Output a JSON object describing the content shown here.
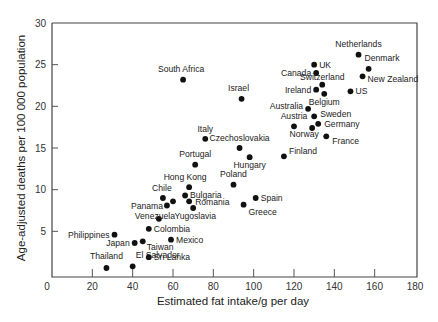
{
  "chart_data": {
    "type": "scatter",
    "title": "",
    "xlabel": "Estimated fat intake/g per day",
    "ylabel": "Age-adjusted deaths per 100 000 population",
    "xlim": [
      0,
      180
    ],
    "ylim": [
      0,
      30
    ],
    "x_ticks": [
      0,
      20,
      40,
      60,
      80,
      100,
      120,
      140,
      160,
      180
    ],
    "y_ticks": [
      5,
      10,
      15,
      20,
      25,
      30
    ],
    "grid": false,
    "legend": null,
    "points": [
      {
        "label": "Netherlands",
        "x": 152,
        "y": 26.2,
        "lx": 0,
        "ly": -8,
        "anchor": "middle"
      },
      {
        "label": "Denmark",
        "x": 157,
        "y": 24.5,
        "lx": -4,
        "ly": -8,
        "anchor": "start"
      },
      {
        "label": "UK",
        "x": 130,
        "y": 25.0,
        "lx": 5,
        "ly": 3,
        "anchor": "start"
      },
      {
        "label": "Canada",
        "x": 131,
        "y": 24.0,
        "lx": -5,
        "ly": 3,
        "anchor": "end"
      },
      {
        "label": "New Zealand",
        "x": 154,
        "y": 23.6,
        "lx": 5,
        "ly": 6,
        "anchor": "start"
      },
      {
        "label": "Switzerland",
        "x": 134,
        "y": 22.6,
        "lx": 0,
        "ly": -5,
        "anchor": "middle"
      },
      {
        "label": "Ireland",
        "x": 131,
        "y": 22.0,
        "lx": -5,
        "ly": 3,
        "anchor": "end"
      },
      {
        "label": "Belgium",
        "x": 135,
        "y": 21.5,
        "lx": 0,
        "ly": 11,
        "anchor": "middle"
      },
      {
        "label": "US",
        "x": 148,
        "y": 21.8,
        "lx": 5,
        "ly": 3,
        "anchor": "start"
      },
      {
        "label": "Israel",
        "x": 94,
        "y": 20.9,
        "lx": -3,
        "ly": -8,
        "anchor": "middle"
      },
      {
        "label": "South Africa",
        "x": 65,
        "y": 23.2,
        "lx": -2,
        "ly": -8,
        "anchor": "middle"
      },
      {
        "label": "Australia",
        "x": 127,
        "y": 19.7,
        "lx": -5,
        "ly": 0,
        "anchor": "end"
      },
      {
        "label": "Sweden",
        "x": 130,
        "y": 18.8,
        "lx": 6,
        "ly": 1,
        "anchor": "start"
      },
      {
        "label": "Austria",
        "x": 120,
        "y": 17.6,
        "lx": 0,
        "ly": -7,
        "anchor": "middle"
      },
      {
        "label": "Germany",
        "x": 132,
        "y": 17.9,
        "lx": 6,
        "ly": 3,
        "anchor": "start"
      },
      {
        "label": "Norway",
        "x": 129,
        "y": 17.4,
        "lx": -8,
        "ly": 9,
        "anchor": "middle"
      },
      {
        "label": "France",
        "x": 136,
        "y": 16.4,
        "lx": 6,
        "ly": 8,
        "anchor": "start"
      },
      {
        "label": "Italy",
        "x": 76,
        "y": 16.1,
        "lx": 0,
        "ly": -7,
        "anchor": "middle"
      },
      {
        "label": "Czechoslovakia",
        "x": 93,
        "y": 15.0,
        "lx": 0,
        "ly": -7,
        "anchor": "middle"
      },
      {
        "label": "Hungary",
        "x": 98,
        "y": 13.9,
        "lx": 0,
        "ly": 11,
        "anchor": "middle"
      },
      {
        "label": "Finland",
        "x": 115,
        "y": 14.0,
        "lx": 5,
        "ly": -2,
        "anchor": "start"
      },
      {
        "label": "Portugal",
        "x": 71,
        "y": 13.0,
        "lx": 0,
        "ly": -8,
        "anchor": "middle"
      },
      {
        "label": "Hong Kong",
        "x": 68,
        "y": 10.3,
        "lx": -4,
        "ly": -7,
        "anchor": "middle"
      },
      {
        "label": "Poland",
        "x": 90,
        "y": 10.6,
        "lx": 0,
        "ly": -8,
        "anchor": "middle"
      },
      {
        "label": "Chile",
        "x": 55,
        "y": 9.0,
        "lx": -1,
        "ly": -7,
        "anchor": "middle"
      },
      {
        "label": "Bulgaria",
        "x": 66,
        "y": 9.3,
        "lx": 5,
        "ly": 2,
        "anchor": "start"
      },
      {
        "label": "Panama",
        "x": 57,
        "y": 8.1,
        "lx": -4,
        "ly": 3,
        "anchor": "end"
      },
      {
        "label": "",
        "x": 60,
        "y": 8.6,
        "lx": 0,
        "ly": 0,
        "anchor": "middle"
      },
      {
        "label": "Romania",
        "x": 68,
        "y": 8.6,
        "lx": 6,
        "ly": 4,
        "anchor": "start"
      },
      {
        "label": "Spain",
        "x": 101,
        "y": 9.0,
        "lx": 5,
        "ly": 3,
        "anchor": "start"
      },
      {
        "label": "Greece",
        "x": 95,
        "y": 8.2,
        "lx": 5,
        "ly": 10,
        "anchor": "start"
      },
      {
        "label": "Yugoslavia",
        "x": 70,
        "y": 7.8,
        "lx": 2,
        "ly": 11,
        "anchor": "middle"
      },
      {
        "label": "Venezuela",
        "x": 53,
        "y": 6.5,
        "lx": -4,
        "ly": 0,
        "anchor": "middle"
      },
      {
        "label": "Colombia",
        "x": 48,
        "y": 5.3,
        "lx": 5,
        "ly": 3,
        "anchor": "start"
      },
      {
        "label": "Philippines",
        "x": 31,
        "y": 4.6,
        "lx": -5,
        "ly": 3,
        "anchor": "end"
      },
      {
        "label": "Mexico",
        "x": 59,
        "y": 4.0,
        "lx": 5,
        "ly": 3,
        "anchor": "start"
      },
      {
        "label": "Japan",
        "x": 41,
        "y": 3.6,
        "lx": -5,
        "ly": 3,
        "anchor": "end"
      },
      {
        "label": "Taiwan",
        "x": 45,
        "y": 3.8,
        "lx": 4,
        "ly": 9,
        "anchor": "start"
      },
      {
        "label": "Sri Lanka",
        "x": 48,
        "y": 1.9,
        "lx": 5,
        "ly": 3,
        "anchor": "start"
      },
      {
        "label": "Thailand",
        "x": 27,
        "y": 0.6,
        "lx": 0,
        "ly": -9,
        "anchor": "middle"
      },
      {
        "label": "El Salvador",
        "x": 40,
        "y": 0.8,
        "lx": 3,
        "ly": -8,
        "anchor": "start"
      }
    ]
  }
}
